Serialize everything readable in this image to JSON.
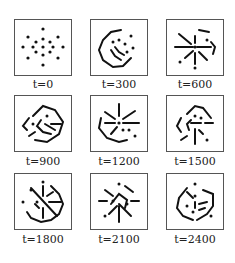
{
  "figure": {
    "panels": [
      {
        "label": "t=0"
      },
      {
        "label": "t=300"
      },
      {
        "label": "t=600"
      },
      {
        "label": "t=900"
      },
      {
        "label": "t=1200"
      },
      {
        "label": "t=1500"
      },
      {
        "label": "t=1800"
      },
      {
        "label": "t=2100"
      },
      {
        "label": "t=2400"
      }
    ]
  }
}
